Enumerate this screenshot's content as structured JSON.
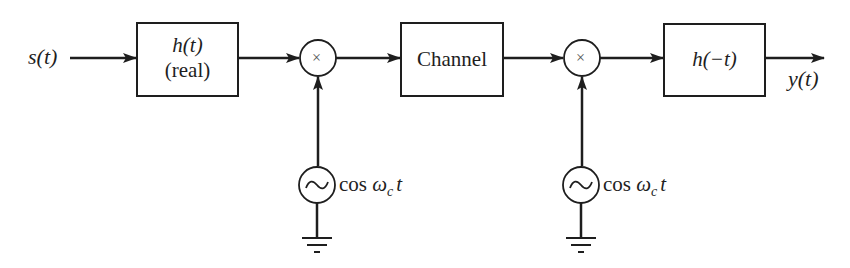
{
  "diagram": {
    "type": "block-diagram",
    "colors": {
      "stroke": "#1e1e1e",
      "background": "#ffffff"
    },
    "input_label": "s(t)",
    "output_label": "y(t)",
    "blocks": [
      {
        "id": "tx-filter",
        "line1": "h(t)",
        "line2": "(real)"
      },
      {
        "id": "channel",
        "line1": "Channel"
      },
      {
        "id": "rx-filter",
        "line1": "h(−t)"
      }
    ],
    "multipliers": [
      {
        "id": "mixer-1",
        "symbol": "×"
      },
      {
        "id": "mixer-2",
        "symbol": "×"
      }
    ],
    "oscillators": [
      {
        "id": "osc-1",
        "symbol": "~",
        "label_prefix": "cos ",
        "label_omega": "ω",
        "label_sub": "c",
        "label_t": "t"
      },
      {
        "id": "osc-2",
        "symbol": "~",
        "label_prefix": "cos ",
        "label_omega": "ω",
        "label_sub": "c",
        "label_t": "t"
      }
    ],
    "connections": [
      "s(t) → h(t)",
      "h(t) → mixer-1",
      "osc-1 → mixer-1",
      "mixer-1 → Channel",
      "Channel → mixer-2",
      "osc-2 → mixer-2",
      "mixer-2 → h(−t)",
      "h(−t) → y(t)"
    ]
  }
}
